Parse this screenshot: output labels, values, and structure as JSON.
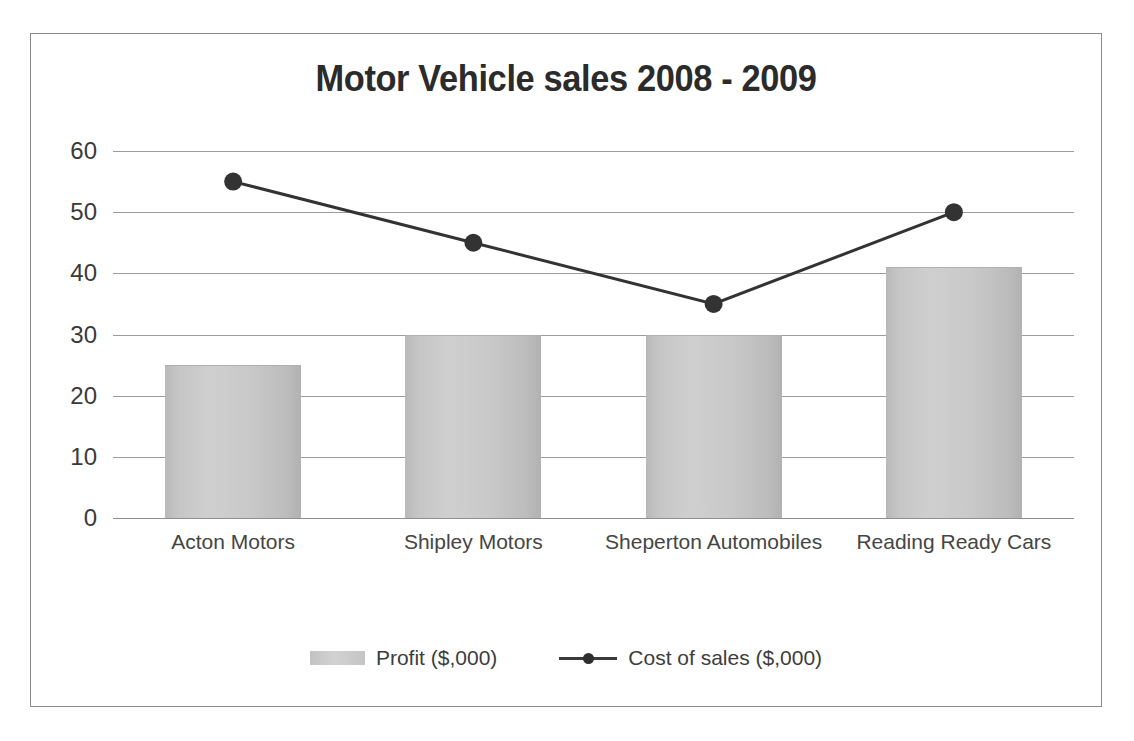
{
  "chart_data": {
    "type": "bar",
    "title": "Motor Vehicle sales 2008 - 2009",
    "xlabel": "",
    "ylabel": "",
    "ylim": [
      0,
      60
    ],
    "yticks": [
      60,
      50,
      40,
      30,
      20,
      10,
      0
    ],
    "grid": true,
    "legend_position": "bottom",
    "categories": [
      "Acton Motors",
      "Shipley Motors",
      "Sheperton Automobiles",
      "Reading Ready Cars"
    ],
    "series": [
      {
        "name": "Profit ($,000)",
        "type": "bar",
        "color": "#c6c6c6",
        "values": [
          25,
          30,
          30,
          41
        ]
      },
      {
        "name": "Cost of sales ($,000)",
        "type": "line",
        "color": "#333333",
        "marker": "circle",
        "values": [
          55,
          45,
          35,
          50
        ]
      }
    ]
  },
  "legend": {
    "items": [
      {
        "label": "Profit ($,000)",
        "marker": "bar-swatch"
      },
      {
        "label": "Cost of sales ($,000)",
        "marker": "line-with-dot"
      }
    ]
  },
  "colors": {
    "frame_border": "#8a8a8a",
    "gridline": "#9c9c9c",
    "bar_fill": "#c6c6c6",
    "line_stroke": "#333333",
    "title_text": "#2b2b2b",
    "tick_text": "#3a3a3a",
    "background": "#ffffff"
  }
}
